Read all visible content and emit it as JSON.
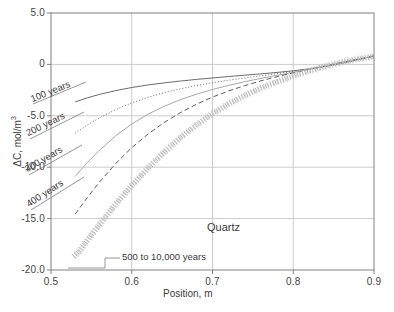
{
  "chart_data": {
    "type": "line",
    "title": "",
    "xlabel": "Position, m",
    "ylabel": "ΔC, mol/m³",
    "ylabel_base": "ΔC, mol/m",
    "ylabel_sup": "3",
    "xlim": [
      0.5,
      0.9
    ],
    "ylim": [
      -20.0,
      5.0
    ],
    "xticks": [
      "0.5",
      "0.6",
      "0.7",
      "0.8",
      "0.9"
    ],
    "xtick_values": [
      0.5,
      0.6,
      0.7,
      0.8,
      0.9
    ],
    "yticks": [
      "5.0",
      "0",
      "-5.0",
      "-10.0",
      "-15.0",
      "-20.0"
    ],
    "ytick_values": [
      5.0,
      0,
      -5.0,
      -10.0,
      -15.0,
      -20.0
    ],
    "grid": true,
    "legend_position": "inline-curve-labels",
    "annotations": [
      {
        "name": "material-note",
        "text": "Quartz",
        "x": 0.735,
        "y": -15.6
      },
      {
        "name": "bundle-note",
        "text": "500 to 10,000 years",
        "x": 0.576,
        "y": -18.3
      }
    ],
    "series": [
      {
        "name": "100 years",
        "label": "100 years",
        "style": "solid",
        "color": "#6b6b6b",
        "x": [
          0.53,
          0.545,
          0.56,
          0.58,
          0.6,
          0.62,
          0.64,
          0.66,
          0.68,
          0.7,
          0.72,
          0.74,
          0.76,
          0.78,
          0.8,
          0.82,
          0.84,
          0.86,
          0.88,
          0.9
        ],
        "y": [
          -3.65,
          -3.25,
          -2.92,
          -2.55,
          -2.25,
          -2.0,
          -1.8,
          -1.62,
          -1.46,
          -1.32,
          -1.18,
          -1.05,
          -0.92,
          -0.78,
          -0.62,
          -0.43,
          -0.2,
          0.1,
          0.45,
          0.85
        ]
      },
      {
        "name": "200 years",
        "label": "200 years",
        "style": "dotted",
        "color": "#6b6b6b",
        "x": [
          0.53,
          0.545,
          0.56,
          0.58,
          0.6,
          0.62,
          0.64,
          0.66,
          0.68,
          0.7,
          0.72,
          0.74,
          0.76,
          0.78,
          0.8,
          0.82,
          0.84,
          0.86,
          0.88,
          0.9
        ],
        "y": [
          -6.7,
          -5.9,
          -5.2,
          -4.4,
          -3.75,
          -3.2,
          -2.75,
          -2.38,
          -2.06,
          -1.78,
          -1.54,
          -1.32,
          -1.11,
          -0.9,
          -0.68,
          -0.45,
          -0.18,
          0.14,
          0.48,
          0.82
        ]
      },
      {
        "name": "300 years",
        "label": "300 years",
        "style": "solid",
        "color": "#a8a8a8",
        "x": [
          0.53,
          0.545,
          0.56,
          0.58,
          0.6,
          0.62,
          0.64,
          0.66,
          0.68,
          0.7,
          0.72,
          0.74,
          0.76,
          0.78,
          0.8,
          0.82,
          0.84,
          0.86,
          0.88,
          0.9
        ],
        "y": [
          -10.9,
          -9.55,
          -8.35,
          -6.95,
          -5.8,
          -4.85,
          -4.08,
          -3.44,
          -2.9,
          -2.44,
          -2.04,
          -1.68,
          -1.36,
          -1.06,
          -0.76,
          -0.46,
          -0.14,
          0.2,
          0.52,
          0.8
        ]
      },
      {
        "name": "400 years",
        "label": "400 years",
        "style": "dashed",
        "color": "#5e5e5e",
        "x": [
          0.53,
          0.545,
          0.56,
          0.58,
          0.6,
          0.62,
          0.64,
          0.66,
          0.68,
          0.7,
          0.72,
          0.74,
          0.76,
          0.78,
          0.8,
          0.82,
          0.84,
          0.86,
          0.88,
          0.9
        ],
        "y": [
          -14.55,
          -12.95,
          -11.45,
          -9.65,
          -8.1,
          -6.78,
          -5.66,
          -4.7,
          -3.88,
          -3.18,
          -2.58,
          -2.06,
          -1.6,
          -1.19,
          -0.82,
          -0.48,
          -0.15,
          0.18,
          0.5,
          0.78
        ]
      },
      {
        "name": "500 to 10,000 years",
        "label": "500 to 10,000 years",
        "style": "thick-dotted-band",
        "color": "#b4b4b4",
        "x": [
          0.528,
          0.535,
          0.545,
          0.56,
          0.58,
          0.6,
          0.62,
          0.64,
          0.66,
          0.68,
          0.7,
          0.72,
          0.74,
          0.76,
          0.78,
          0.8,
          0.82,
          0.84,
          0.86,
          0.88,
          0.9
        ],
        "y": [
          -18.7,
          -18.2,
          -17.1,
          -15.6,
          -13.6,
          -11.8,
          -10.1,
          -8.55,
          -7.15,
          -5.9,
          -4.8,
          -3.85,
          -3.02,
          -2.3,
          -1.68,
          -1.12,
          -0.62,
          -0.18,
          0.2,
          0.52,
          0.78
        ]
      }
    ],
    "curve_label_positions": [
      {
        "series": "100 years",
        "left": 33,
        "top": 93,
        "rotate": -22
      },
      {
        "series": "200 years",
        "left": 29,
        "top": 127,
        "rotate": -26
      },
      {
        "series": "300 years",
        "left": 28,
        "top": 163,
        "rotate": -30
      },
      {
        "series": "400 years",
        "left": 30,
        "top": 198,
        "rotate": -33
      }
    ]
  }
}
